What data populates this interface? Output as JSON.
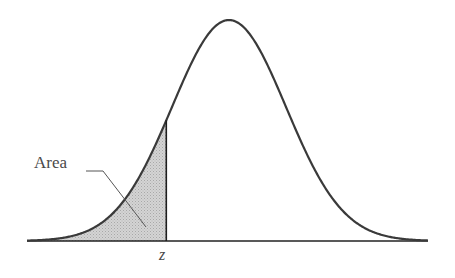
{
  "figure": {
    "area_label": "Area",
    "z_label": "z"
  },
  "colors": {
    "curve": "#3a3a3a",
    "shade": "#c9c9c9",
    "axis": "#222222",
    "text": "#4a4a4a"
  },
  "chart_data": {
    "type": "area",
    "title": "",
    "distribution": "normal",
    "mean": 0,
    "sd": 1,
    "shaded_region": {
      "from": "-inf",
      "to": "z"
    },
    "z_approx": -1.1,
    "annotations": [
      "Area",
      "z"
    ],
    "xlabel": "",
    "ylabel": "",
    "grid": false,
    "legend": null
  }
}
